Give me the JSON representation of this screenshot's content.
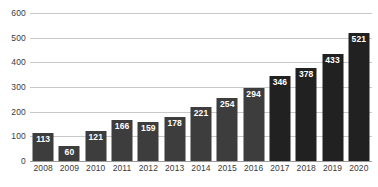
{
  "chart_data": {
    "type": "bar",
    "title": "",
    "subtitle": "",
    "xlabel": "",
    "ylabel": "",
    "categories": [
      "2008",
      "2009",
      "2010",
      "2011",
      "2012",
      "2013",
      "2014",
      "2015",
      "2016",
      "2017",
      "2018",
      "2019",
      "2020"
    ],
    "values": [
      113,
      60,
      121,
      166,
      159,
      178,
      221,
      254,
      294,
      346,
      378,
      433,
      521
    ],
    "data_labels": [
      "113",
      "60",
      "121",
      "166",
      "159",
      "178",
      "221",
      "254",
      "294",
      "346",
      "378",
      "433",
      "521"
    ],
    "ylim": [
      0,
      600
    ],
    "yticks": [
      0,
      100,
      200,
      300,
      400,
      500,
      600
    ],
    "ytick_labels": [
      "0",
      "100",
      "200",
      "300",
      "400",
      "500",
      "600"
    ],
    "grid": true,
    "grid_axis": "y",
    "legend": false,
    "legend_position": "none",
    "bar_colors": [
      "#3d3d3d",
      "#3d3d3d",
      "#3d3d3d",
      "#3d3d3d",
      "#3d3d3d",
      "#3d3d3d",
      "#3d3d3d",
      "#3d3d3d",
      "#3d3d3d",
      "#212121",
      "#212121",
      "#212121",
      "#212121"
    ],
    "colors": {
      "bar_light": "#3d3d3d",
      "bar_dark": "#212121",
      "gridline": "#c9c9c9",
      "baseline": "#9a9a9a",
      "axis_text": "#3a3a3a",
      "data_label_text": "#ffffff",
      "background": "#ffffff"
    }
  }
}
